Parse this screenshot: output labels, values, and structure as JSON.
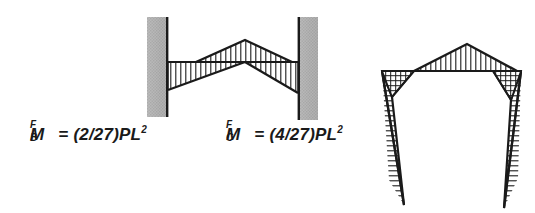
{
  "figure": {
    "background_color": "#ffffff",
    "ink_color": "#1a1a1a",
    "support_fill_color": "#b0b0b0"
  },
  "labels": {
    "moment_b": {
      "symbol": "M",
      "superscript": "F",
      "subscript": "B",
      "equals": "=",
      "coefficient": "(2/27)",
      "term": "PL",
      "exponent": "2",
      "full_text": "M_B^F = (2/27)PL2"
    },
    "moment_c": {
      "symbol": "M",
      "superscript": "F",
      "subscript": "C",
      "equals": "=",
      "coefficient": "(4/27)",
      "term": "PL",
      "exponent": "2",
      "full_text": "M_C^F = (4/27)PL2"
    }
  },
  "beam_diagram": {
    "name": "fixed-end beam moment diagram",
    "left_support": {
      "x": 147,
      "y": 17,
      "width": 21,
      "height": 100
    },
    "right_support": {
      "x": 298,
      "y": 17,
      "width": 20,
      "height": 103
    },
    "baseline_y": 62,
    "baseline_x_start": 168,
    "baseline_x_end": 298,
    "left_negative_peak": {
      "x": 168,
      "y": 90
    },
    "right_negative_peak": {
      "x": 298,
      "y": 93
    },
    "positive_apex": {
      "x": 245,
      "y": 40
    },
    "hatch_orientation": "vertical"
  },
  "frame_diagram": {
    "name": "frame moment diagram",
    "top_left_corner": {
      "x": 382,
      "y": 71
    },
    "top_right_corner": {
      "x": 521,
      "y": 71
    },
    "apex": {
      "x": 467,
      "y": 44
    },
    "left_leg_tip": {
      "x": 404,
      "y": 205
    },
    "right_leg_tip": {
      "x": 504,
      "y": 208
    },
    "left_knee": {
      "x": 392,
      "y": 97
    },
    "right_knee": {
      "x": 511,
      "y": 100
    },
    "corner_hatch": "cross-hatch",
    "leg_hatch": "horizontal",
    "apex_hatch": "vertical"
  }
}
